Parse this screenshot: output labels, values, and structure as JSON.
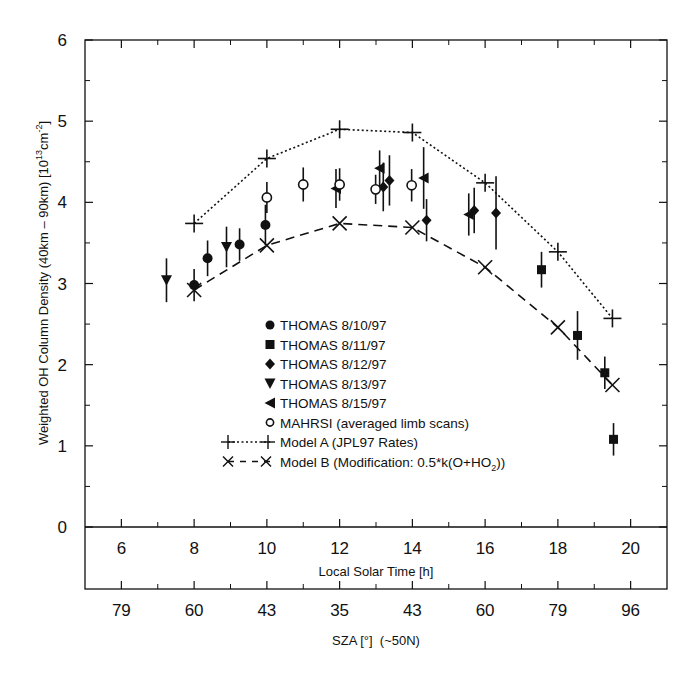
{
  "chart_data": {
    "type": "scatter",
    "title": "",
    "ylabel": "Weighted OH Column Density (40km - 90km) [10^13 cm^-2]",
    "ylabel_parts": {
      "main": "Weighted OH Column Density (40km – 90km) [10",
      "sup1": "13",
      "mid": "cm",
      "sup2": "-2",
      "end": "]"
    },
    "xlabel": "Local Solar Time [h]",
    "xlabel2": "SZA [°]  (~50N)",
    "xlim": [
      5,
      21
    ],
    "ylim": [
      0,
      6
    ],
    "x_ticks": [
      6,
      8,
      10,
      12,
      14,
      16,
      18,
      20
    ],
    "x_minor_ticks": [
      7,
      9,
      11,
      13,
      15,
      17,
      19
    ],
    "y_ticks": [
      0,
      1,
      2,
      3,
      4,
      5,
      6
    ],
    "y_minor_ticks": [
      0.5,
      1.5,
      2.5,
      3.5,
      4.5,
      5.5
    ],
    "sza_tick_labels": [
      "79",
      "60",
      "43",
      "35",
      "43",
      "60",
      "79",
      "96"
    ],
    "grid": false,
    "legend_position": "lower center inside plot",
    "series": [
      {
        "name": "THOMAS 8/10/97",
        "marker": "circle-filled",
        "points": [
          [
            8.0,
            2.98,
            0.2
          ],
          [
            8.37,
            3.31,
            0.22
          ],
          [
            9.25,
            3.48,
            0.2
          ],
          [
            9.96,
            3.72,
            0.25
          ]
        ]
      },
      {
        "name": "THOMAS 8/11/97",
        "marker": "square-filled",
        "points": [
          [
            17.55,
            3.17,
            0.22
          ],
          [
            18.54,
            2.36,
            0.3
          ],
          [
            19.29,
            1.9,
            0.2
          ],
          [
            19.53,
            1.08,
            0.2
          ]
        ]
      },
      {
        "name": "THOMAS 8/12/97",
        "marker": "diamond-filled",
        "points": [
          [
            13.2,
            4.19,
            0.3
          ],
          [
            13.37,
            4.27,
            0.31
          ],
          [
            14.39,
            3.78,
            0.26
          ],
          [
            15.7,
            3.9,
            0.28
          ],
          [
            16.3,
            3.87,
            0.45
          ]
        ]
      },
      {
        "name": "THOMAS 8/13/97",
        "marker": "triangle-down-filled",
        "points": [
          [
            7.24,
            3.04,
            0.27
          ],
          [
            8.89,
            3.45,
            0.25
          ]
        ]
      },
      {
        "name": "THOMAS 8/15/97",
        "marker": "triangle-left-filled",
        "points": [
          [
            11.9,
            4.17,
            0.24
          ],
          [
            13.1,
            4.42,
            0.22
          ],
          [
            14.31,
            4.3,
            0.38
          ],
          [
            15.55,
            3.85,
            0.26
          ]
        ]
      },
      {
        "name": "MAHRSI (averaged limb scans)",
        "marker": "circle-open",
        "points": [
          [
            10.0,
            4.06,
            0.19
          ],
          [
            11.0,
            4.22,
            0.21
          ],
          [
            12.0,
            4.22,
            0.2
          ],
          [
            12.99,
            4.16,
            0.18
          ],
          [
            13.98,
            4.21,
            0.2
          ]
        ]
      },
      {
        "name": "Model A (JPL97 Rates)",
        "marker": "plus",
        "line": "dotted",
        "points": [
          [
            8,
            3.74
          ],
          [
            10,
            4.54
          ],
          [
            12,
            4.9
          ],
          [
            14,
            4.86
          ],
          [
            16,
            4.24
          ],
          [
            18,
            3.39
          ],
          [
            19.5,
            2.57
          ]
        ]
      },
      {
        "name": "Model B (Modification: 0.5*k(O+HO2))",
        "marker": "cross",
        "line": "dashed",
        "points": [
          [
            8,
            2.92
          ],
          [
            10,
            3.47
          ],
          [
            12,
            3.74
          ],
          [
            14,
            3.69
          ],
          [
            16,
            3.2
          ],
          [
            18,
            2.46
          ],
          [
            19.5,
            1.75
          ]
        ]
      }
    ]
  },
  "legend": {
    "items": [
      {
        "label": "THOMAS 8/10/97",
        "marker": "circle-filled"
      },
      {
        "label": "THOMAS 8/11/97",
        "marker": "square-filled"
      },
      {
        "label": "THOMAS 8/12/97",
        "marker": "diamond-filled"
      },
      {
        "label": "THOMAS 8/13/97",
        "marker": "triangle-down-filled"
      },
      {
        "label": "THOMAS 8/15/97",
        "marker": "triangle-left-filled"
      },
      {
        "label": "MAHRSI (averaged limb scans)",
        "marker": "circle-open"
      },
      {
        "label": "Model A (JPL97 Rates)",
        "marker": "plus",
        "line": "dotted"
      },
      {
        "label": "Model B (Modification: 0.5*k(O+HO",
        "sub": "2",
        "tail": "))",
        "marker": "cross",
        "line": "dashed"
      }
    ]
  },
  "colors": {
    "ink": "#111111",
    "background": "#ffffff"
  }
}
